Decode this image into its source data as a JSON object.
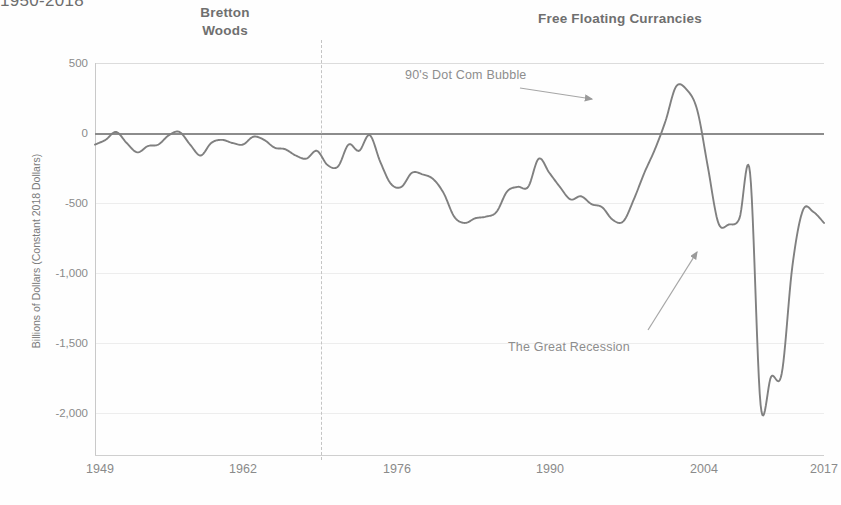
{
  "header": {
    "title": "1950-2018",
    "era_left": "Bretton Woods",
    "era_left_line1": "Bretton",
    "era_left_line2": "Woods",
    "era_right": "Free Floating Currancies"
  },
  "annotations": {
    "dotcom": "90's Dot Com Bubble",
    "recession": "The Great Recession"
  },
  "chart_data": {
    "type": "line",
    "title": "1950-2018",
    "xlabel": "",
    "ylabel": "Billions of Dollars (Constant 2018 Dollars)",
    "xlim": [
      1949,
      2018
    ],
    "ylim": [
      -2000,
      500
    ],
    "xticks": [
      "1949",
      "1962",
      "1976",
      "1990",
      "2004",
      "2017"
    ],
    "xtick_values": [
      1949,
      1962,
      1976,
      1990,
      2004,
      2017
    ],
    "yticks": [
      "500",
      "0",
      "-500",
      "-1,000",
      "-1,500",
      "-2,000"
    ],
    "ytick_values": [
      500,
      0,
      -500,
      -1000,
      -1500,
      -2000
    ],
    "grid": true,
    "legend": "none",
    "line_color": "#808080",
    "zero_line_color": "#8c8c8c",
    "era_divider_year": 1971,
    "annotations": [
      {
        "text": "90's Dot Com Bubble",
        "point_year": 2000,
        "point_value": 350,
        "arrow": "right"
      },
      {
        "text": "The Great Recession",
        "point_year": 2008,
        "point_value": -700,
        "arrow": "up-right"
      }
    ],
    "series": [
      {
        "name": "U.S. Trade Balance",
        "x": [
          1949,
          1950,
          1951,
          1952,
          1953,
          1954,
          1955,
          1956,
          1957,
          1958,
          1959,
          1960,
          1961,
          1962,
          1963,
          1964,
          1965,
          1966,
          1967,
          1968,
          1969,
          1970,
          1971,
          1972,
          1973,
          1974,
          1975,
          1976,
          1977,
          1978,
          1979,
          1980,
          1981,
          1982,
          1983,
          1984,
          1985,
          1986,
          1987,
          1988,
          1989,
          1990,
          1991,
          1992,
          1993,
          1994,
          1995,
          1996,
          1997,
          1998,
          1999,
          2000,
          2001,
          2002,
          2003,
          2004,
          2005,
          2006,
          2007,
          2008,
          2009,
          2010,
          2011,
          2012,
          2013,
          2014,
          2015,
          2016,
          2017,
          2018
        ],
        "values": [
          -20,
          10,
          60,
          -10,
          -70,
          -30,
          -20,
          40,
          60,
          -20,
          -90,
          -10,
          10,
          -10,
          -20,
          30,
          10,
          -40,
          -50,
          -90,
          -110,
          -60,
          -150,
          -160,
          -20,
          -60,
          40,
          -130,
          -270,
          -290,
          -200,
          -210,
          -240,
          -330,
          -480,
          -520,
          -490,
          -480,
          -450,
          -320,
          -290,
          -290,
          -110,
          -200,
          -290,
          -370,
          -350,
          -400,
          -420,
          -500,
          -510,
          -370,
          -200,
          -50,
          130,
          350,
          330,
          200,
          -160,
          -520,
          -530,
          -490,
          -200,
          -1680,
          -1500,
          -1480,
          -800,
          -440,
          -450,
          -520
        ],
        "note": "Curve estimated from plotted pixel positions"
      }
    ]
  },
  "ytick_positions": [
    63,
    133,
    203,
    273,
    343,
    413
  ],
  "xtick_positions": [
    100,
    243,
    397,
    550,
    704,
    824
  ]
}
